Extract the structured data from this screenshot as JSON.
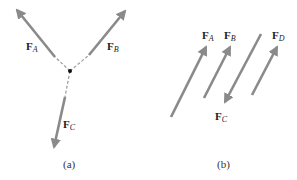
{
  "figure_a": {
    "caption": "(a)",
    "center": [
      70,
      71
    ],
    "forces": [
      {
        "name": "F",
        "sub": "A",
        "tail": [
          55,
          57
        ],
        "tip": [
          15,
          8
        ],
        "dash_from": [
          70,
          71
        ],
        "dash_to": [
          55,
          57
        ],
        "label_pos": [
          26,
          42
        ]
      },
      {
        "name": "F",
        "sub": "B",
        "tail": [
          89,
          55
        ],
        "tip": [
          127,
          9
        ],
        "dash_from": [
          70,
          71
        ],
        "dash_to": [
          89,
          55
        ],
        "label_pos": [
          108,
          42
        ]
      },
      {
        "name": "F",
        "sub": "C",
        "tail": [
          65,
          97
        ],
        "tip": [
          53,
          150
        ],
        "dash_from": [
          70,
          71
        ],
        "dash_to": [
          65,
          97
        ],
        "label_pos": [
          63,
          120
        ]
      }
    ]
  },
  "figure_b": {
    "caption": "(b)",
    "forces": [
      {
        "name": "F",
        "sub": "A",
        "tail": [
          171,
          117
        ],
        "tip": [
          207,
          45
        ],
        "label_pos": [
          202,
          31
        ]
      },
      {
        "name": "F",
        "sub": "B",
        "tail": [
          204,
          98
        ],
        "tip": [
          231,
          45
        ],
        "label_pos": [
          225,
          31
        ]
      },
      {
        "name": "F",
        "sub": "C",
        "tail": [
          261,
          34
        ],
        "tip": [
          224,
          104
        ],
        "label_pos": [
          215,
          112
        ]
      },
      {
        "name": "F",
        "sub": "D",
        "tail": [
          252,
          95
        ],
        "tip": [
          278,
          45
        ],
        "label_pos": [
          272,
          31
        ]
      }
    ]
  },
  "colors": {
    "arrow": "#8a8a8a",
    "dash": "#999999",
    "point": "#111111",
    "text": "#222222"
  }
}
